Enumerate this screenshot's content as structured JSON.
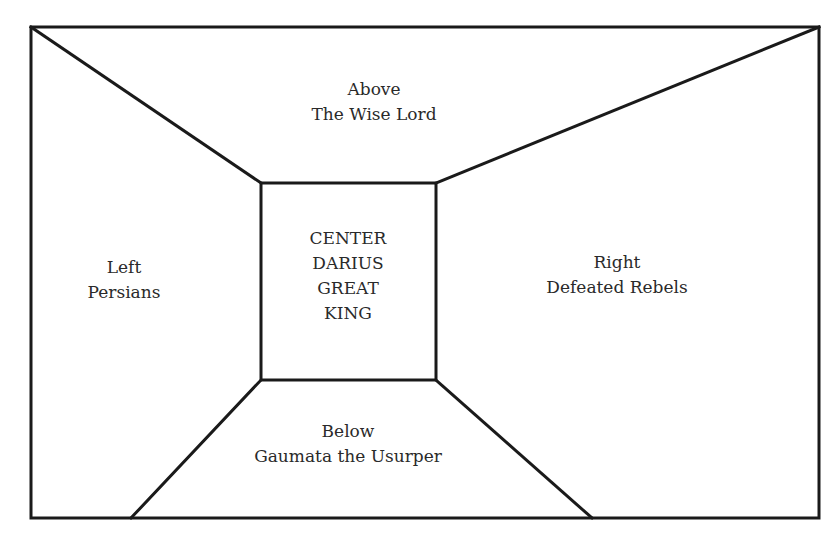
{
  "diagram": {
    "type": "perspective-room",
    "line_color": "#1a1a1a",
    "outer_frame": {
      "x1": 31,
      "y1": 27,
      "x2": 819,
      "y2": 518
    },
    "inner_box": {
      "x1": 261,
      "y1": 183,
      "x2": 436,
      "y2": 380
    },
    "bottom_trapezoid_base": {
      "left_x": 131,
      "right_x": 592
    },
    "regions": {
      "above": {
        "line1": "Above",
        "line2": "The Wise Lord"
      },
      "left": {
        "line1": "Left",
        "line2": "Persians"
      },
      "right": {
        "line1": "Right",
        "line2": "Defeated Rebels"
      },
      "below": {
        "line1": "Below",
        "line2": "Gaumata the Usurper"
      },
      "center": {
        "line1": "CENTER",
        "line2": "DARIUS",
        "line3": "GREAT",
        "line4": "KING"
      }
    }
  }
}
